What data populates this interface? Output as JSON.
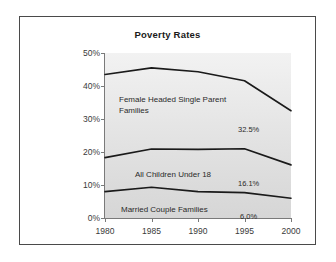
{
  "chart_data": {
    "type": "line",
    "title": "Poverty Rates",
    "xlabel": "",
    "ylabel": "",
    "x": [
      1980,
      1985,
      1990,
      1995,
      2000
    ],
    "xtick_labels": [
      "1980",
      "1985",
      "1990",
      "1995",
      "2000"
    ],
    "ytick_labels": [
      "0%",
      "10%",
      "20%",
      "30%",
      "40%",
      "50%"
    ],
    "ytick_values": [
      0,
      10,
      20,
      30,
      40,
      50
    ],
    "ylim": [
      0,
      50
    ],
    "xlim": [
      1980,
      2000
    ],
    "grid": false,
    "legend": "none",
    "series": [
      {
        "name": "Female Headed Single Parent Families",
        "values": [
          43.5,
          45.5,
          44.3,
          41.6,
          32.5
        ],
        "end_label": "32.5%"
      },
      {
        "name": "All Children Under 18",
        "values": [
          18.3,
          20.9,
          20.8,
          21.0,
          16.1
        ],
        "end_label": "16.1%"
      },
      {
        "name": "Married Couple Families",
        "values": [
          8.0,
          9.3,
          8.0,
          7.7,
          6.0
        ],
        "end_label": "6.0%"
      }
    ],
    "annotations": [
      {
        "text": "Female Headed Single Parent\nFamilies"
      },
      {
        "text": "All Children Under 18"
      },
      {
        "text": "Married Couple Families"
      }
    ],
    "colors": {
      "line": "#1a1a1a",
      "plot_background": "#e6e6e6",
      "frame_border": "#4a4a4a",
      "axis": "#7a7a7a",
      "text": "#2a2a2a"
    }
  }
}
